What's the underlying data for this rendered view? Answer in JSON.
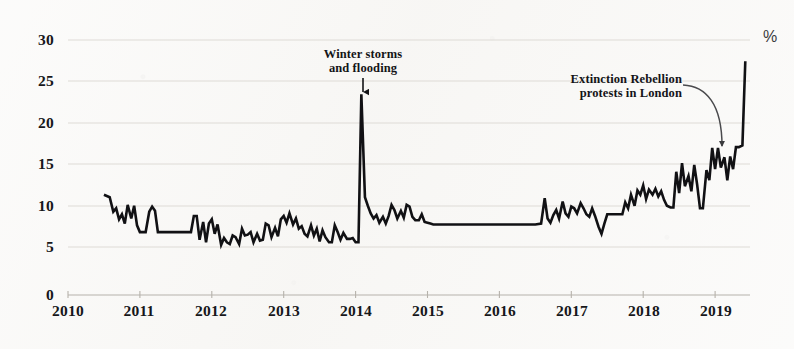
{
  "chart_data": {
    "type": "line",
    "title": "",
    "subtitle": "",
    "xlabel": "",
    "ylabel": "",
    "unit_label": "%",
    "grid": true,
    "legend": null,
    "xlim": [
      2010,
      2019.6
    ],
    "ylim": [
      0,
      30
    ],
    "xticks": [
      "2010",
      "2011",
      "2012",
      "2013",
      "2014",
      "2015",
      "2016",
      "2017",
      "2018",
      "2019"
    ],
    "yticks": [
      "0",
      "5",
      "10",
      "15",
      "20",
      "25",
      "30"
    ],
    "line_color": "#111114",
    "grid_color": "#dedbd6",
    "series": [
      {
        "name": "Concern about environment",
        "color": "#111114",
        "x": [
          2010.5,
          2010.58,
          2010.63,
          2010.67,
          2010.71,
          2010.75,
          2010.79,
          2010.83,
          2010.88,
          2010.92,
          2010.96,
          2011.0,
          2011.04,
          2011.08,
          2011.13,
          2011.17,
          2011.21,
          2011.25,
          2011.29,
          2011.33,
          2011.38,
          2011.42,
          2011.46,
          2011.5,
          2011.54,
          2011.58,
          2011.63,
          2011.67,
          2011.71,
          2011.75,
          2011.79,
          2011.83,
          2011.88,
          2011.92,
          2011.96,
          2012.0,
          2012.04,
          2012.08,
          2012.13,
          2012.17,
          2012.21,
          2012.25,
          2012.29,
          2012.33,
          2012.38,
          2012.42,
          2012.46,
          2012.5,
          2012.54,
          2012.58,
          2012.63,
          2012.67,
          2012.71,
          2012.75,
          2012.79,
          2012.83,
          2012.88,
          2012.92,
          2012.96,
          2013.0,
          2013.04,
          2013.08,
          2013.13,
          2013.17,
          2013.21,
          2013.25,
          2013.29,
          2013.33,
          2013.38,
          2013.42,
          2013.46,
          2013.5,
          2013.54,
          2013.58,
          2013.63,
          2013.67,
          2013.71,
          2013.75,
          2013.79,
          2013.83,
          2013.88,
          2013.92,
          2013.96,
          2014.0,
          2014.04,
          2014.08,
          2014.13,
          2014.17,
          2014.21,
          2014.25,
          2014.29,
          2014.33,
          2014.38,
          2014.42,
          2014.46,
          2014.5,
          2014.54,
          2014.58,
          2014.63,
          2014.67,
          2014.71,
          2014.75,
          2014.79,
          2014.83,
          2014.88,
          2014.92,
          2014.96,
          2015.0,
          2015.04,
          2015.08,
          2015.13,
          2015.17,
          2015.21,
          2015.25,
          2015.29,
          2016.42,
          2016.5,
          2016.58,
          2016.63,
          2016.67,
          2016.71,
          2016.75,
          2016.79,
          2016.83,
          2016.88,
          2016.92,
          2016.96,
          2017.0,
          2017.04,
          2017.08,
          2017.13,
          2017.17,
          2017.21,
          2017.25,
          2017.29,
          2017.33,
          2017.38,
          2017.42,
          2017.46,
          2017.5,
          2017.54,
          2017.58,
          2017.63,
          2017.67,
          2017.71,
          2017.75,
          2017.79,
          2017.83,
          2017.88,
          2017.92,
          2017.96,
          2018.0,
          2018.04,
          2018.08,
          2018.13,
          2018.17,
          2018.21,
          2018.25,
          2018.29,
          2018.33,
          2018.38,
          2018.42,
          2018.46,
          2018.5,
          2018.54,
          2018.58,
          2018.63,
          2018.67,
          2018.71,
          2018.75,
          2018.79,
          2018.83,
          2018.88,
          2018.92,
          2018.96,
          2019.0,
          2019.04,
          2019.08,
          2019.13,
          2019.17,
          2019.21,
          2019.25,
          2019.29,
          2019.33,
          2019.38,
          2019.42
        ],
        "values": [
          11.8,
          11.5,
          9.8,
          10.2,
          8.9,
          9.5,
          8.4,
          10.6,
          9.0,
          10.5,
          8.2,
          7.4,
          7.4,
          7.4,
          9.8,
          10.4,
          9.9,
          7.4,
          7.4,
          7.4,
          7.4,
          7.4,
          7.4,
          7.4,
          7.4,
          7.4,
          7.4,
          7.4,
          7.4,
          9.3,
          9.3,
          6.5,
          8.6,
          6.2,
          8.4,
          8.9,
          7.2,
          8.3,
          5.9,
          6.7,
          6.2,
          6.0,
          7.0,
          6.8,
          6.0,
          7.8,
          7.0,
          7.1,
          7.4,
          6.2,
          7.2,
          6.4,
          6.5,
          8.4,
          8.2,
          6.8,
          7.9,
          6.9,
          8.9,
          9.3,
          8.5,
          9.6,
          8.3,
          9.0,
          7.8,
          8.1,
          7.2,
          6.9,
          8.2,
          7.0,
          7.8,
          6.3,
          7.6,
          6.8,
          6.2,
          6.2,
          8.2,
          7.4,
          6.5,
          7.3,
          6.6,
          6.6,
          6.7,
          6.2,
          6.2,
          23.6,
          11.5,
          10.5,
          9.6,
          9.0,
          9.4,
          8.5,
          9.2,
          8.4,
          9.3,
          10.6,
          10.0,
          9.0,
          9.9,
          9.1,
          10.6,
          10.4,
          9.2,
          8.8,
          8.8,
          9.5,
          8.6,
          8.5,
          8.4,
          8.3,
          8.3,
          8.3,
          8.3,
          8.3,
          8.3,
          8.3,
          8.3,
          8.4,
          11.4,
          9.0,
          8.5,
          9.4,
          10.0,
          9.0,
          11.0,
          9.6,
          9.2,
          10.4,
          10.2,
          9.6,
          10.8,
          10.2,
          9.5,
          9.2,
          10.2,
          9.3,
          8.0,
          7.2,
          8.4,
          9.5,
          9.5,
          9.5,
          9.5,
          9.5,
          9.5,
          10.9,
          10.2,
          11.8,
          10.5,
          12.3,
          11.8,
          12.9,
          11.3,
          12.4,
          11.8,
          12.5,
          11.6,
          12.2,
          11.2,
          10.5,
          10.3,
          10.3,
          14.5,
          12.0,
          15.5,
          12.8,
          14.0,
          12.2,
          15.3,
          13.0,
          10.2,
          10.2,
          14.7,
          13.5,
          17.3,
          14.8,
          17.3,
          15.0,
          16.2,
          13.5,
          16.3,
          14.8,
          17.4,
          17.4,
          17.6,
          27.5
        ]
      }
    ],
    "annotations": [
      {
        "id": "winter-storms",
        "lines": [
          "Winter storms",
          "and flooding"
        ],
        "x": 2014.08,
        "y": 25.5,
        "arrow": "down"
      },
      {
        "id": "extinction-rebellion",
        "lines": [
          "Extinction Rebellion",
          "protests in London"
        ],
        "x": 2018.05,
        "y": 22.0,
        "arrow": "curved"
      }
    ]
  },
  "axis": {
    "y_labels": [
      "30",
      "25",
      "20",
      "15",
      "10",
      "5",
      "0"
    ],
    "x_labels": [
      "2010",
      "2011",
      "2012",
      "2013",
      "2014",
      "2015",
      "2016",
      "2017",
      "2018",
      "2019"
    ],
    "unit": "%"
  },
  "annotations": {
    "winter": {
      "line1": "Winter storms",
      "line2": "and flooding"
    },
    "extinction": {
      "line1": "Extinction Rebellion",
      "line2": "protests in London"
    }
  }
}
